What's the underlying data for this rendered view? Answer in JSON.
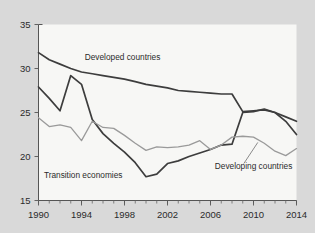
{
  "chart_data": {
    "type": "line",
    "title": "",
    "xlabel": "",
    "ylabel": "",
    "xlim": [
      1990,
      2014
    ],
    "ylim": [
      15,
      35
    ],
    "y_ticks": [
      15,
      20,
      25,
      30,
      35
    ],
    "x_ticks": [
      1990,
      1994,
      1998,
      2002,
      2006,
      2010,
      2014
    ],
    "x_tick_labels": [
      "1990",
      "1994",
      "1998",
      "2002",
      "2006",
      "2010",
      "2014"
    ],
    "y_tick_labels": [
      "15",
      "20",
      "25",
      "30",
      "35"
    ],
    "x_minor_tick_interval": 1,
    "grid": false,
    "legend_position": "inline-annotations",
    "x": [
      1990,
      1991,
      1992,
      1993,
      1994,
      1995,
      1996,
      1997,
      1998,
      1999,
      2000,
      2001,
      2002,
      2003,
      2004,
      2005,
      2006,
      2007,
      2008,
      2009,
      2010,
      2011,
      2012,
      2013,
      2014
    ],
    "series": [
      {
        "name": "Developed countries",
        "color": "#3d3d3d",
        "width": 1.7,
        "values": [
          31.8,
          31.0,
          30.5,
          30.0,
          29.6,
          29.4,
          29.2,
          29.0,
          28.8,
          28.5,
          28.2,
          28.0,
          27.8,
          27.5,
          27.4,
          27.3,
          27.2,
          27.1,
          27.1,
          25.1,
          25.2,
          25.3,
          25.0,
          24.5,
          24.0
        ]
      },
      {
        "name": "Transition economies",
        "color": "#3d3d3d",
        "width": 1.7,
        "values": [
          27.9,
          26.6,
          25.2,
          29.2,
          28.2,
          24.2,
          22.6,
          21.5,
          20.5,
          19.3,
          17.7,
          18.0,
          19.2,
          19.5,
          20.0,
          20.4,
          20.8,
          21.3,
          21.4,
          25.0,
          25.1,
          25.4,
          25.0,
          24.0,
          22.5
        ]
      },
      {
        "name": "Developing countries",
        "color": "#9a9a9a",
        "width": 1.3,
        "values": [
          24.4,
          23.4,
          23.6,
          23.3,
          21.8,
          24.0,
          23.3,
          23.2,
          22.4,
          21.5,
          20.7,
          21.1,
          21.0,
          21.1,
          21.3,
          21.8,
          20.8,
          21.3,
          22.2,
          22.3,
          22.2,
          21.5,
          20.6,
          20.1,
          20.9
        ]
      }
    ],
    "annotations": [
      {
        "text": "Developed countries",
        "x": 1994.3,
        "y": 31.0,
        "anchor": "start"
      },
      {
        "text": "Transition economies",
        "x": 1990.5,
        "y": 17.6,
        "anchor": "start"
      },
      {
        "text": "Developing countries",
        "x": 2006.4,
        "y": 18.6,
        "anchor": "start"
      }
    ],
    "style": {
      "figure_background": "#d9d9d9",
      "plot_background": "#f7f7f5",
      "axis_color": "#555555",
      "text_color": "#2b2b2b"
    }
  }
}
